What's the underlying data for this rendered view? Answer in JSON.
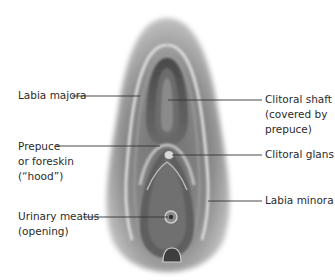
{
  "diagram": {
    "colors": {
      "background": "#ffffff",
      "text": "#2b2b2b",
      "leader_line": "#333333",
      "tissue_dark": "#5a5a5a",
      "tissue_light": "#cfcfcf"
    },
    "labels": {
      "left": [
        {
          "id": "labia-majora",
          "lines": [
            "Labia majora"
          ]
        },
        {
          "id": "prepuce",
          "lines": [
            "Prepuce",
            "or foreskin",
            "(“hood”)"
          ]
        },
        {
          "id": "urinary-meatus",
          "lines": [
            "Urinary meatus",
            "(opening)"
          ]
        }
      ],
      "right": [
        {
          "id": "clitoral-shaft",
          "lines": [
            "Clitoral shaft",
            "(covered by",
            "prepuce)"
          ]
        },
        {
          "id": "clitoral-glans",
          "lines": [
            "Clitoral glans"
          ]
        },
        {
          "id": "labia-minora",
          "lines": [
            "Labia minora"
          ]
        }
      ]
    }
  }
}
